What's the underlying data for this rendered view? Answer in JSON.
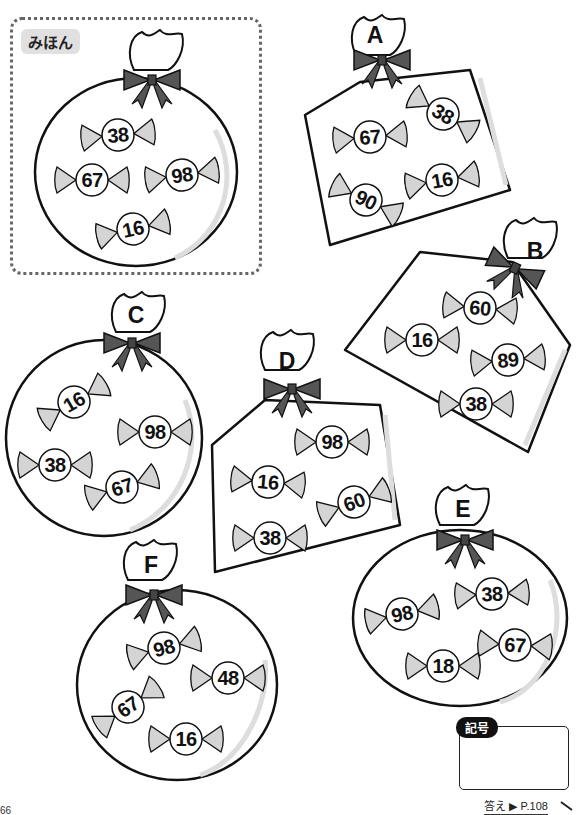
{
  "sample": {
    "label": "みほん",
    "candies": [
      "38",
      "67",
      "98",
      "16"
    ]
  },
  "bags": [
    {
      "letter": "A",
      "shape": "square",
      "candies": [
        "38",
        "67",
        "90",
        "16"
      ]
    },
    {
      "letter": "B",
      "shape": "square",
      "candies": [
        "60",
        "16",
        "89",
        "38"
      ]
    },
    {
      "letter": "C",
      "shape": "round",
      "candies": [
        "16",
        "98",
        "38",
        "67"
      ]
    },
    {
      "letter": "D",
      "shape": "square",
      "candies": [
        "98",
        "16",
        "60",
        "38"
      ]
    },
    {
      "letter": "E",
      "shape": "round",
      "candies": [
        "38",
        "98",
        "67",
        "18"
      ]
    },
    {
      "letter": "F",
      "shape": "round",
      "candies": [
        "98",
        "48",
        "67",
        "16"
      ]
    }
  ],
  "answer": {
    "tag_label": "記号",
    "value": "",
    "reference": "答え ▶ P.108"
  },
  "page_number": "66",
  "colors": {
    "ribbon": "#555555",
    "candy_wrapper": "#d4d4d4",
    "outline": "#111111",
    "frame": "#666666"
  }
}
